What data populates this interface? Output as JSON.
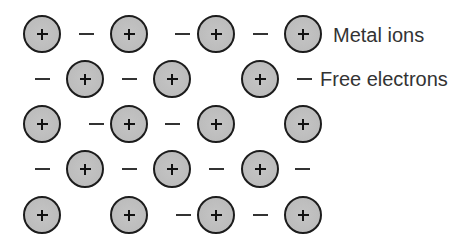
{
  "diagram": {
    "title": "",
    "colors": {
      "ion_fill": "#bdbdbd",
      "ion_stroke": "#1c1c1c",
      "plus": "#111111",
      "electron": "#333333",
      "label": "#333333",
      "background": "#ffffff"
    },
    "legend": {
      "metal_ions": {
        "label": "Metal ions",
        "x": 333,
        "y": 35
      },
      "free_electrons": {
        "label": "Free electrons",
        "x": 320,
        "y": 79
      }
    },
    "ions": [
      {
        "x": 42,
        "y": 34
      },
      {
        "x": 129,
        "y": 34
      },
      {
        "x": 216,
        "y": 34
      },
      {
        "x": 303,
        "y": 34
      },
      {
        "x": 85,
        "y": 79
      },
      {
        "x": 172,
        "y": 79
      },
      {
        "x": 260,
        "y": 79
      },
      {
        "x": 42,
        "y": 124
      },
      {
        "x": 129,
        "y": 124
      },
      {
        "x": 216,
        "y": 124
      },
      {
        "x": 303,
        "y": 124
      },
      {
        "x": 85,
        "y": 169
      },
      {
        "x": 172,
        "y": 169
      },
      {
        "x": 260,
        "y": 169
      },
      {
        "x": 42,
        "y": 215
      },
      {
        "x": 129,
        "y": 215
      },
      {
        "x": 216,
        "y": 215
      },
      {
        "x": 303,
        "y": 215
      }
    ],
    "electrons": [
      {
        "x": 86,
        "y": 34
      },
      {
        "x": 182,
        "y": 34
      },
      {
        "x": 260,
        "y": 34
      },
      {
        "x": 42,
        "y": 79
      },
      {
        "x": 129,
        "y": 79
      },
      {
        "x": 304,
        "y": 79
      },
      {
        "x": 96,
        "y": 124
      },
      {
        "x": 172,
        "y": 124
      },
      {
        "x": 42,
        "y": 169
      },
      {
        "x": 129,
        "y": 169
      },
      {
        "x": 216,
        "y": 169
      },
      {
        "x": 302,
        "y": 169
      },
      {
        "x": 183,
        "y": 215
      },
      {
        "x": 260,
        "y": 215
      }
    ]
  }
}
